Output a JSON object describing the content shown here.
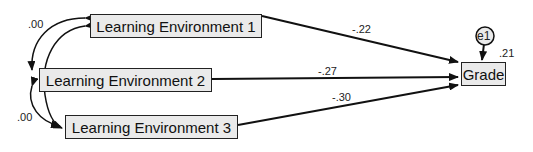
{
  "diagram": {
    "type": "path_diagram",
    "nodes": [
      {
        "id": "le1",
        "label": "Learning Environment 1"
      },
      {
        "id": "le2",
        "label": "Learning Environment 2"
      },
      {
        "id": "le3",
        "label": "Learning Environment 3"
      },
      {
        "id": "grade",
        "label": "Grade"
      },
      {
        "id": "e1",
        "label": "e1"
      }
    ],
    "paths": [
      {
        "from": "le1",
        "to": "grade",
        "coef": "-.22"
      },
      {
        "from": "le2",
        "to": "grade",
        "coef": "-.27"
      },
      {
        "from": "le3",
        "to": "grade",
        "coef": "-.30"
      },
      {
        "from": "e1",
        "to": "grade",
        "coef": ""
      }
    ],
    "covariances": [
      {
        "between": [
          "le1",
          "le2"
        ],
        "value": ".00"
      },
      {
        "between": [
          "le2",
          "le3"
        ],
        "value": ".00"
      },
      {
        "between": [
          "le1",
          "le3"
        ],
        "value": ""
      }
    ],
    "r_squared": {
      "node": "grade",
      "value": ".21"
    }
  }
}
